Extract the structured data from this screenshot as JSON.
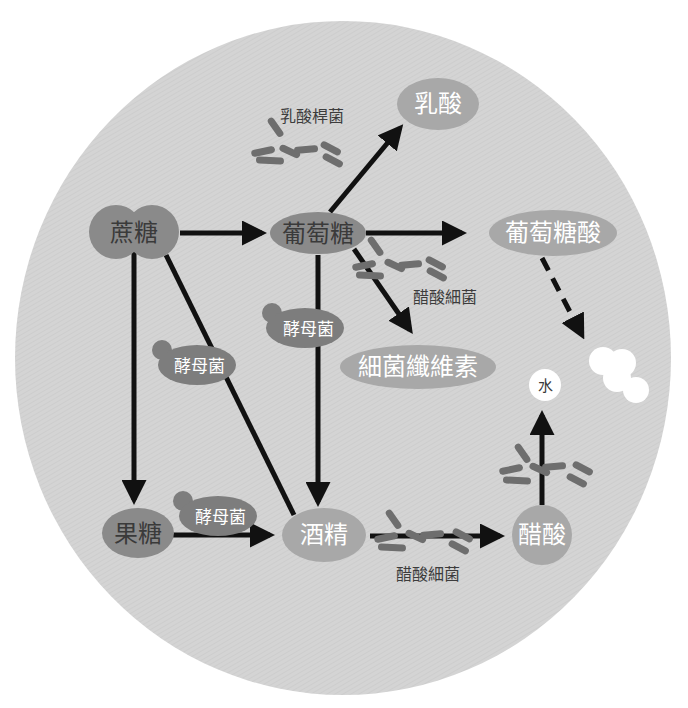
{
  "diagram": {
    "type": "fermentation-pathway",
    "colors": {
      "background_circle": "#d4d4d4",
      "node_dark": "#8a8a8a",
      "node_light": "#a8a8a8",
      "yeast_blob": "#7d7d7d",
      "bacteria": "#6e6e6e",
      "arrow": "#111111",
      "white_nodes": "#ffffff"
    },
    "nodes": {
      "sucrose": "蔗糖",
      "glucose": "葡萄糖",
      "lactic_acid": "乳酸",
      "gluconic_acid": "葡萄糖酸",
      "bacterial_cellulose": "細菌纖維素",
      "fructose": "果糖",
      "ethanol": "酒精",
      "acetic_acid": "醋酸",
      "water": "水"
    },
    "organisms": {
      "lactobacillus": "乳酸桿菌",
      "acetobacter_top": "醋酸細菌",
      "acetobacter_bottom": "醋酸細菌",
      "yeast_left": "酵母菌",
      "yeast_center": "酵母菌",
      "yeast_bottom": "酵母菌"
    },
    "edges": [
      {
        "from": "蔗糖",
        "to": "葡萄糖",
        "style": "solid"
      },
      {
        "from": "蔗糖",
        "to": "果糖",
        "style": "solid"
      },
      {
        "from": "蔗糖",
        "to": "酒精",
        "style": "solid",
        "agent": "酵母菌"
      },
      {
        "from": "葡萄糖",
        "to": "乳酸",
        "style": "solid",
        "agent": "乳酸桿菌"
      },
      {
        "from": "葡萄糖",
        "to": "葡萄糖酸",
        "style": "solid"
      },
      {
        "from": "葡萄糖",
        "to": "細菌纖維素",
        "style": "solid",
        "agent": "醋酸細菌"
      },
      {
        "from": "葡萄糖",
        "to": "酒精",
        "style": "solid",
        "agent": "酵母菌"
      },
      {
        "from": "果糖",
        "to": "酒精",
        "style": "solid",
        "agent": "酵母菌"
      },
      {
        "from": "酒精",
        "to": "醋酸",
        "style": "solid",
        "agent": "醋酸細菌"
      },
      {
        "from": "醋酸",
        "to": "水",
        "style": "solid"
      },
      {
        "from": "葡萄糖酸",
        "to": "white-cluster",
        "style": "dashed"
      }
    ]
  }
}
